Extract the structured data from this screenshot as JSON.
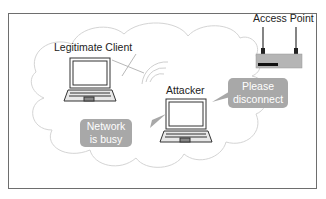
{
  "diagram": {
    "nodes": {
      "legitimate_client": {
        "label": "Legitimate Client",
        "icon": "laptop-icon"
      },
      "attacker": {
        "label": "Attacker",
        "icon": "laptop-icon"
      },
      "access_point": {
        "label": "Access Point",
        "icon": "router-icon"
      }
    },
    "bubbles": {
      "please_disconnect": {
        "line1": "Please",
        "line2": "disconnect",
        "from": "attacker",
        "to": "access_point"
      },
      "network_busy": {
        "line1": "Network",
        "line2": "is busy",
        "from": "attacker",
        "to": "legitimate_client"
      }
    },
    "signals": {
      "blocked_link": "crossed-out wireless link between legitimate client and access point",
      "attacker_waves": "wifi wave arcs radiating from attacker"
    },
    "colors": {
      "frame": "#6e6e6e",
      "cloud_outline": "#d0d0d0",
      "bubble_fill": "#a8a8a8",
      "bubble_text": "#ffffff",
      "device_stroke": "#333333"
    }
  }
}
